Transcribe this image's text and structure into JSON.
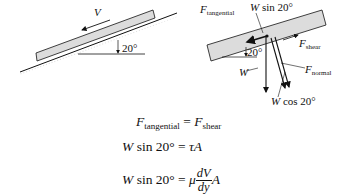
{
  "left_diagram": {
    "velocity_label": "V",
    "angle_label": "20°"
  },
  "right_diagram": {
    "f_tangential": {
      "symbol": "F",
      "sub": "tangential"
    },
    "w_sin": {
      "symbol": "W",
      "rest": " sin 20°"
    },
    "f_shear": {
      "symbol": "F",
      "sub": "shear"
    },
    "angle_label": "20°",
    "weight": "W",
    "f_normal": {
      "symbol": "F",
      "sub": "normal"
    },
    "w_cos": {
      "symbol": "W",
      "rest": " cos 20°"
    }
  },
  "equations": [
    {
      "lhs_symbol": "F",
      "lhs_sub": "tangential",
      "op": " = ",
      "rhs_symbol": "F",
      "rhs_sub": "shear"
    },
    {
      "lhs_symbol": "W",
      "lhs_rest": " sin 20°",
      "op": " = ",
      "rhs": "τA"
    },
    {
      "lhs_symbol": "W",
      "lhs_rest": " sin 20°",
      "op": " = ",
      "mu": "μ",
      "num": "dV",
      "den": "dy",
      "tail": "A"
    }
  ],
  "colors": {
    "block_fill": "#dcdcdc",
    "stroke": "#111111"
  }
}
